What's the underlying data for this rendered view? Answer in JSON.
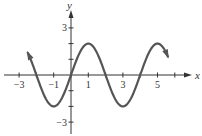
{
  "chart_data": {
    "type": "line",
    "title": "",
    "xlabel": "x",
    "ylabel": "y",
    "function": "y = 2 sin(pi x / 2)",
    "xlim": [
      -3.5,
      6.5
    ],
    "ylim": [
      -3.3,
      3.6
    ],
    "x_tick_labels": [
      "-3",
      "-1",
      "1",
      "3",
      "5"
    ],
    "y_tick_labels": [
      "3",
      "-3"
    ],
    "x_ticks": [
      -3,
      -2,
      -1,
      0,
      1,
      2,
      3,
      4,
      5,
      6
    ],
    "y_ticks": [
      -3,
      -2,
      -1,
      1,
      2,
      3
    ],
    "grid": false,
    "series": [
      {
        "name": "curve",
        "color": "#555555",
        "x": [
          -2.5,
          -2,
          -1,
          0,
          1,
          2,
          3,
          4,
          5,
          5.6
        ],
        "y": [
          1.41,
          0,
          -2,
          0,
          2,
          0,
          -2,
          0,
          2,
          1.18
        ],
        "arrows": "both ends"
      }
    ]
  },
  "colors": {
    "axis": "#333333",
    "curve": "#555555"
  }
}
